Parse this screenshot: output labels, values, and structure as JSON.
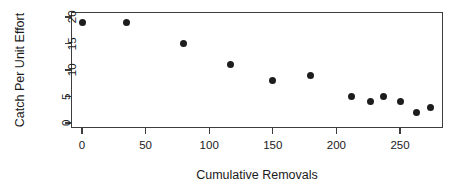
{
  "chart_data": {
    "type": "scatter",
    "title": "",
    "xlabel": "Cumulative Removals",
    "ylabel": "Catch Per Unit Effort",
    "xlim": [
      -7,
      285
    ],
    "ylim": [
      -1,
      21
    ],
    "xticks": [
      0,
      50,
      100,
      150,
      200,
      250
    ],
    "yticks": [
      0,
      5,
      10,
      15,
      20
    ],
    "xtick_labels": [
      "0",
      "50",
      "100",
      "150",
      "200",
      "250"
    ],
    "ytick_labels": [
      "0",
      "5",
      "10",
      "15",
      "20"
    ],
    "grid": false,
    "legend": "none",
    "marker": "filled-circle",
    "marker_color": "#1d1d1d",
    "frame_color": "#3d3d3d",
    "background": "#ffffff",
    "x": [
      0,
      35,
      80,
      117,
      150,
      180,
      212,
      227,
      237,
      250,
      263,
      274
    ],
    "y": [
      19,
      19,
      15,
      11,
      8,
      9,
      5,
      4,
      5,
      4,
      2,
      3
    ],
    "points": [
      {
        "x": 0,
        "y": 19
      },
      {
        "x": 35,
        "y": 19
      },
      {
        "x": 80,
        "y": 15
      },
      {
        "x": 117,
        "y": 11
      },
      {
        "x": 150,
        "y": 8
      },
      {
        "x": 180,
        "y": 9
      },
      {
        "x": 212,
        "y": 5
      },
      {
        "x": 227,
        "y": 4
      },
      {
        "x": 237,
        "y": 5
      },
      {
        "x": 250,
        "y": 4
      },
      {
        "x": 263,
        "y": 2
      },
      {
        "x": 274,
        "y": 3
      }
    ]
  }
}
